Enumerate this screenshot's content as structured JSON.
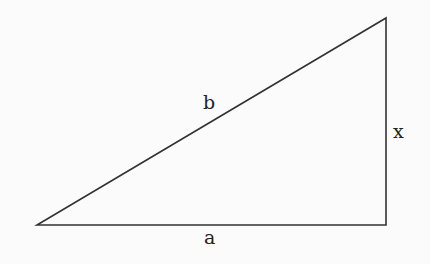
{
  "diagram": {
    "type": "right-triangle",
    "stroke_color": "#333333",
    "background": "#fbfbfb",
    "vertices": {
      "left": [
        37,
        225
      ],
      "right_angle": [
        386,
        225
      ],
      "top": [
        386,
        18
      ]
    },
    "labels": {
      "hypotenuse": "b",
      "vertical_side": "x",
      "base": "a"
    }
  }
}
